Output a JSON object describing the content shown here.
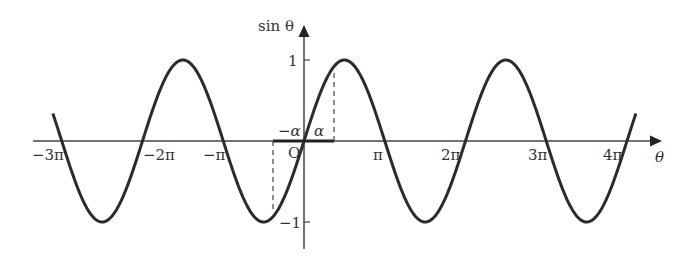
{
  "chart_data": {
    "type": "line",
    "title": "",
    "function": "sin θ",
    "xlabel": "θ",
    "ylabel": "sin θ",
    "x_tick_labels": [
      "−3π",
      "−2π",
      "−π",
      "π",
      "2π",
      "3π",
      "4π"
    ],
    "x_tick_values": [
      -3,
      -2,
      -1,
      1,
      2,
      3,
      4
    ],
    "x_tick_unit": "π",
    "y_tick_labels": [
      "1",
      "−1"
    ],
    "y_tick_values": [
      1,
      -1
    ],
    "origin_label": "O",
    "xlim_pi": [
      -3.3,
      4.3
    ],
    "ylim": [
      -1.4,
      1.4
    ],
    "curve_domain_pi": [
      -3.11,
      4.11
    ],
    "series": [
      {
        "name": "sin θ",
        "x_pi": [
          -3.11,
          -3,
          -2.5,
          -2,
          -1.5,
          -1,
          -0.5,
          0,
          0.5,
          1,
          1.5,
          2,
          2.5,
          3,
          3.5,
          4,
          4.11
        ],
        "y": [
          0.34,
          0,
          -1,
          0,
          1,
          0,
          -1,
          0,
          1,
          0,
          -1,
          0,
          1,
          0,
          -1,
          0,
          0.34
        ]
      }
    ],
    "annotations": [
      {
        "label": "α",
        "x_pi": 0.37,
        "note": "dashed vertical from axis to curve at θ = α"
      },
      {
        "label": "−α",
        "x_pi": -0.37,
        "note": "dashed vertical from axis to curve at θ = −α"
      },
      {
        "note": "thick segment on θ-axis from −α to α"
      }
    ],
    "grid": false,
    "legend": "none"
  },
  "labels": {
    "ylabel": "sin θ",
    "xlabel": "θ",
    "origin": "O",
    "alpha": "α",
    "neg_alpha": "−α",
    "y_pos": "1",
    "y_neg": "−1",
    "ticks": [
      "−3π",
      "−2π",
      "−π",
      "π",
      "2π",
      "3π",
      "4π"
    ]
  },
  "style": {
    "curve_color": "#2b2b2b",
    "axis_color": "#444444"
  }
}
